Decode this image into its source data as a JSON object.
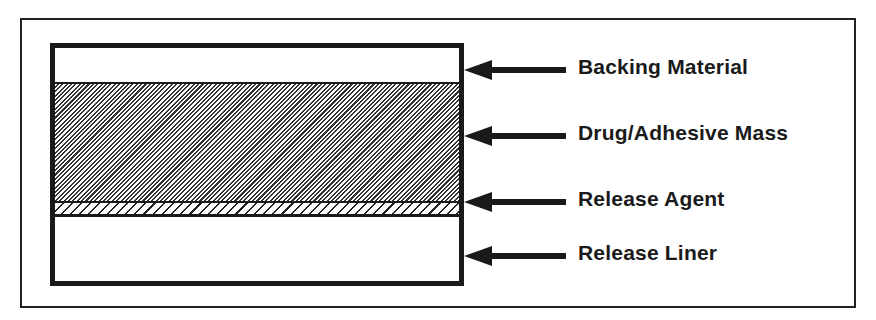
{
  "diagram": {
    "layers": [
      {
        "id": "backing",
        "label": "Backing Material"
      },
      {
        "id": "drug",
        "label": "Drug/Adhesive Mass"
      },
      {
        "id": "agent",
        "label": "Release Agent"
      },
      {
        "id": "liner",
        "label": "Release Liner"
      }
    ],
    "colors": {
      "stroke": "#1a1a1a",
      "background": "#ffffff"
    }
  }
}
